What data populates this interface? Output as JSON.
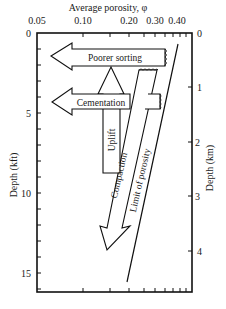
{
  "figure": {
    "x_axis": {
      "title": "Average porosity, φ",
      "scale": "log",
      "ticks": [
        "0.05",
        "0.10",
        "0.20",
        "0.30",
        "0.40"
      ]
    },
    "y_axis_left": {
      "title": "Depth (kft)",
      "ticks": [
        "0",
        "5",
        "10",
        "15"
      ]
    },
    "y_axis_right": {
      "title": "Depth (km)",
      "ticks": [
        "0",
        "1",
        "2",
        "3",
        "4"
      ]
    },
    "annotations": {
      "poorer_sorting": "Poorer sorting",
      "cementation": "Cementation",
      "uplift": "Uplift",
      "compaction": "Compaction",
      "limit_of_porosity": "Limit of porosity"
    }
  }
}
